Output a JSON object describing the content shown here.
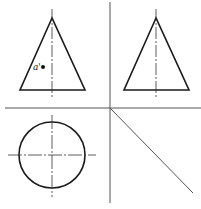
{
  "diagram": {
    "type": "orthographic-projection",
    "colors": {
      "outline": "#1a1a1a",
      "axis": "#555555",
      "centerline": "#333333",
      "background": "#ffffff"
    },
    "views": {
      "front": {
        "name": "front-view",
        "shape": "triangle"
      },
      "side": {
        "name": "side-view",
        "shape": "triangle"
      },
      "top": {
        "name": "top-view",
        "shape": "circle"
      }
    },
    "point": {
      "label": "a'"
    }
  }
}
